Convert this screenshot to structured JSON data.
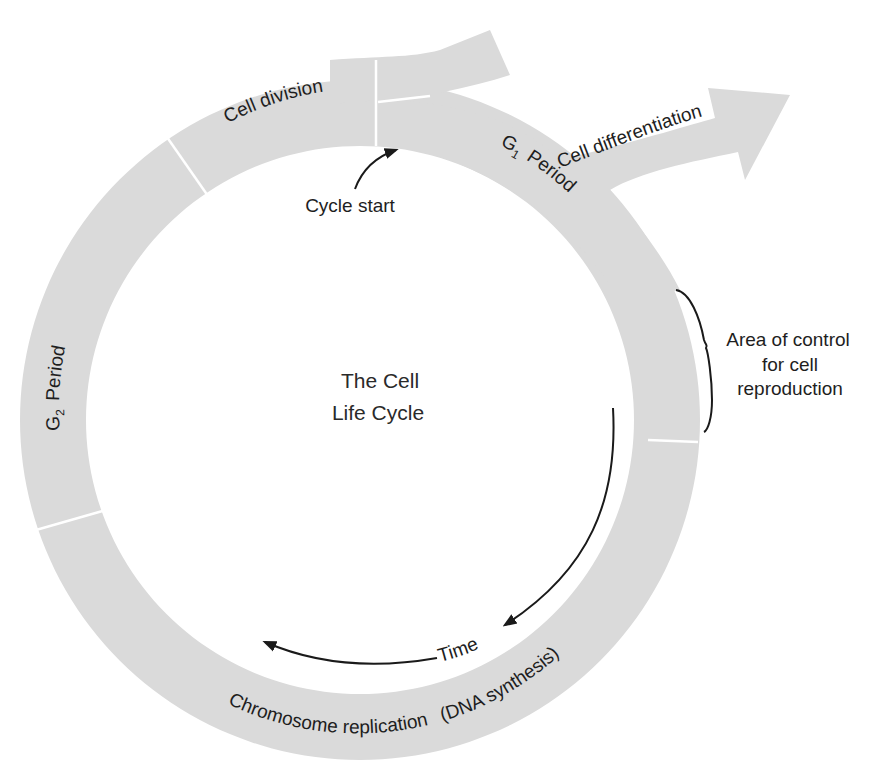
{
  "diagram": {
    "center_title": [
      "The Cell",
      "Life Cycle"
    ],
    "phases": {
      "cell_division": "Cell division",
      "g1_prefix": "G",
      "g1_sub": "1",
      "g1_suffix": "Period",
      "g2_prefix": "G",
      "g2_sub": "2",
      "g2_suffix": "Period",
      "s_phase": "Chromosome replication",
      "s_phase_note": "(DNA synthesis)"
    },
    "branch_label": "Cell differentiation",
    "cycle_start_label": "Cycle start",
    "time_label": "Time",
    "control_note": [
      "Area of control",
      "for cell",
      "reproduction"
    ],
    "colors": {
      "band": "#dadada",
      "divider": "#ffffff",
      "text": "#1e1e1e",
      "background": "#ffffff"
    }
  }
}
